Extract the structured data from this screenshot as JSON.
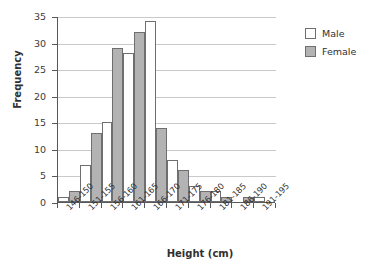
{
  "chart_data": {
    "type": "bar",
    "title": "",
    "subtitle": "",
    "xlabel": "Height (cm)",
    "ylabel": "Frequency",
    "categories": [
      "146-150",
      "151-155",
      "156-160",
      "161-165",
      "166-170",
      "171-175",
      "176-180",
      "181-185",
      "186-190",
      "191-195"
    ],
    "series": [
      {
        "name": "Male",
        "color": "#ffffff",
        "values": [
          1,
          7,
          15,
          28,
          34,
          8,
          3,
          2,
          0,
          1
        ]
      },
      {
        "name": "Female",
        "color": "#b3b3b3",
        "values": [
          2,
          13,
          29,
          32,
          14,
          6,
          2,
          1,
          1,
          0
        ]
      }
    ],
    "ylim": [
      0,
      35
    ],
    "yticks": [
      0,
      5,
      10,
      15,
      20,
      25,
      30,
      35
    ],
    "ytick_labels": [
      "0",
      "5",
      "10",
      "15",
      "20",
      "25",
      "30",
      "35"
    ],
    "grid": true,
    "grid_axis": "y",
    "legend_position": "right",
    "bar_border_color": "#6f6f72",
    "axis_color": "#58585a",
    "grid_color": "#c9c9cb",
    "background": "#ffffff"
  }
}
